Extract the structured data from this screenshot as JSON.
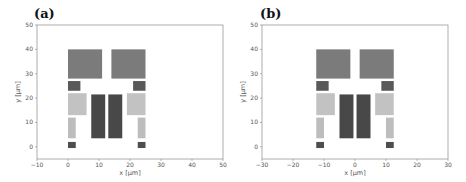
{
  "chart_data": [
    {
      "type": "rectangles",
      "panel_label": "(a)",
      "xlabel": "x [µm]",
      "ylabel": "y [µm]",
      "xlim": [
        -10,
        50
      ],
      "ylim": [
        -5,
        50
      ],
      "xticks": [
        -10,
        0,
        10,
        20,
        30,
        40,
        50
      ],
      "yticks": [
        0,
        10,
        20,
        30,
        40,
        50
      ],
      "grid": false,
      "rects": [
        {
          "x0": 0,
          "x1": 11,
          "y0": 28,
          "y1": 40,
          "color": "#7b7b7b"
        },
        {
          "x0": 14,
          "x1": 25,
          "y0": 28,
          "y1": 40,
          "color": "#7b7b7b"
        },
        {
          "x0": 0,
          "x1": 4,
          "y0": 23,
          "y1": 27,
          "color": "#595959"
        },
        {
          "x0": 21,
          "x1": 25,
          "y0": 23,
          "y1": 27,
          "color": "#595959"
        },
        {
          "x0": 0,
          "x1": 6,
          "y0": 13,
          "y1": 22,
          "color": "#c2c2c2"
        },
        {
          "x0": 19,
          "x1": 25,
          "y0": 13,
          "y1": 22,
          "color": "#c2c2c2"
        },
        {
          "x0": 7.5,
          "x1": 12,
          "y0": 3.5,
          "y1": 21.5,
          "color": "#484848"
        },
        {
          "x0": 13,
          "x1": 17.5,
          "y0": 3.5,
          "y1": 21.5,
          "color": "#484848"
        },
        {
          "x0": 0,
          "x1": 2.5,
          "y0": 3.5,
          "y1": 12,
          "color": "#bdbdbd"
        },
        {
          "x0": 22.5,
          "x1": 25,
          "y0": 3.5,
          "y1": 12,
          "color": "#bdbdbd"
        },
        {
          "x0": 0,
          "x1": 2.5,
          "y0": -0.5,
          "y1": 2,
          "color": "#4e4e4e"
        },
        {
          "x0": 22.5,
          "x1": 25,
          "y0": -0.5,
          "y1": 2,
          "color": "#4e4e4e"
        }
      ]
    },
    {
      "type": "rectangles",
      "panel_label": "(b)",
      "xlabel": "x [µm]",
      "ylabel": "y [µm]",
      "xlim": [
        -30,
        30
      ],
      "ylim": [
        -5,
        50
      ],
      "xticks": [
        -30,
        -20,
        -10,
        0,
        10,
        20,
        30
      ],
      "yticks": [
        0,
        10,
        20,
        30,
        40,
        50
      ],
      "grid": false,
      "rects": [
        {
          "x0": -12.5,
          "x1": -1.5,
          "y0": 28,
          "y1": 40,
          "color": "#7b7b7b"
        },
        {
          "x0": 1.5,
          "x1": 12.5,
          "y0": 28,
          "y1": 40,
          "color": "#7b7b7b"
        },
        {
          "x0": -12.5,
          "x1": -8.5,
          "y0": 23,
          "y1": 27,
          "color": "#595959"
        },
        {
          "x0": 8.5,
          "x1": 12.5,
          "y0": 23,
          "y1": 27,
          "color": "#595959"
        },
        {
          "x0": -12.5,
          "x1": -6.5,
          "y0": 13,
          "y1": 22,
          "color": "#c2c2c2"
        },
        {
          "x0": 6.5,
          "x1": 12.5,
          "y0": 13,
          "y1": 22,
          "color": "#c2c2c2"
        },
        {
          "x0": -5,
          "x1": -0.5,
          "y0": 3.5,
          "y1": 21.5,
          "color": "#484848"
        },
        {
          "x0": 0.5,
          "x1": 5,
          "y0": 3.5,
          "y1": 21.5,
          "color": "#484848"
        },
        {
          "x0": -12.5,
          "x1": -10,
          "y0": 3.5,
          "y1": 12,
          "color": "#bdbdbd"
        },
        {
          "x0": 10,
          "x1": 12.5,
          "y0": 3.5,
          "y1": 12,
          "color": "#bdbdbd"
        },
        {
          "x0": -12.5,
          "x1": -10,
          "y0": -0.5,
          "y1": 2,
          "color": "#4e4e4e"
        },
        {
          "x0": 10,
          "x1": 12.5,
          "y0": -0.5,
          "y1": 2,
          "color": "#4e4e4e"
        }
      ]
    }
  ]
}
